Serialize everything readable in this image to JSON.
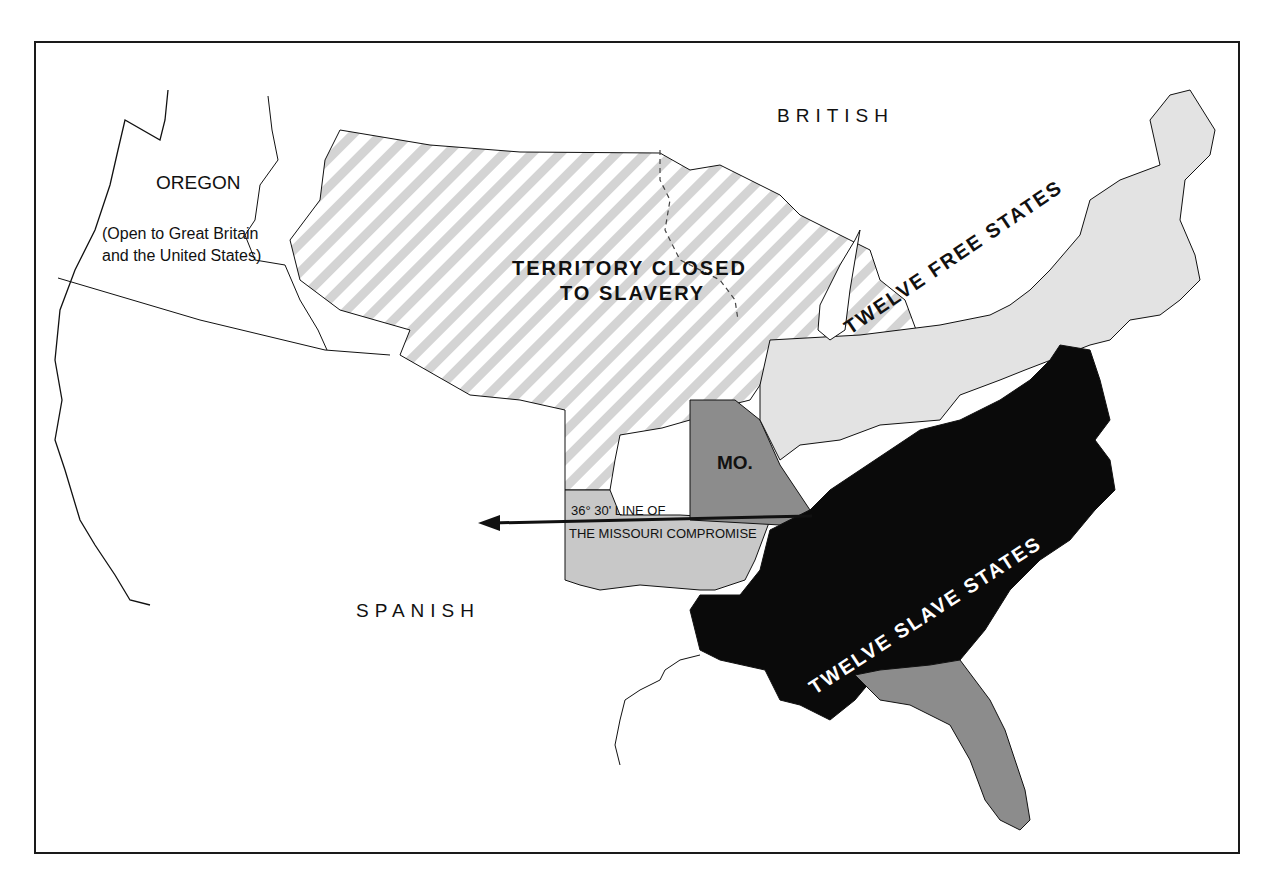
{
  "map": {
    "region_labels": {
      "british": "BRITISH",
      "spanish": "SPANISH",
      "oregon": "OREGON",
      "oregon_note_line1": "(Open to Great Britain",
      "oregon_note_line2": "and the United States)",
      "territory_line1": "TERRITORY CLOSED",
      "territory_line2": "TO SLAVERY",
      "missouri": "MO.",
      "free_states": "TWELVE FREE STATES",
      "slave_states": "TWELVE SLAVE STATES",
      "compromise_line1": "36° 30' LINE OF",
      "compromise_line2": "THE MISSOURI COMPROMISE"
    },
    "legend_colors": {
      "free_states": "#e3e3e3",
      "slave_states": "#0a0a0a",
      "missouri": "#8c8c8c",
      "florida": "#8c8c8c",
      "arkansas_territory": "#c8c8c8",
      "closed_territory_stripe": "#d4d4d4",
      "unorganized": "#ffffff",
      "border": "#1a1a1a"
    }
  }
}
